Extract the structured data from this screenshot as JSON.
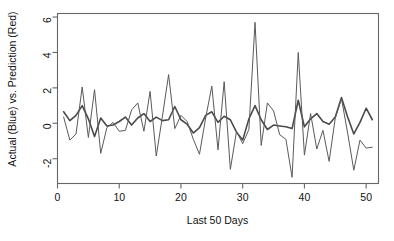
{
  "chart_data": {
    "type": "line",
    "title": "",
    "xlabel": "Last 50 Days",
    "ylabel": "Actual (Blue) vs. Prediction (Red)",
    "xlim": [
      0,
      52
    ],
    "ylim": [
      -3.4,
      6.2
    ],
    "xticks": [
      0,
      10,
      20,
      30,
      40,
      50
    ],
    "xtick_labels": [
      "0",
      "10",
      "20",
      "30",
      "40",
      "50"
    ],
    "yticks": [
      -2,
      0,
      2,
      4,
      6
    ],
    "ytick_labels": [
      "-2",
      "0",
      "2",
      "4",
      "6"
    ],
    "grid": false,
    "legend": "none",
    "frame": true,
    "x": [
      1,
      2,
      3,
      4,
      5,
      6,
      7,
      8,
      9,
      10,
      11,
      12,
      13,
      14,
      15,
      16,
      17,
      18,
      19,
      20,
      21,
      22,
      23,
      24,
      25,
      26,
      27,
      28,
      29,
      30,
      31,
      32,
      33,
      34,
      35,
      36,
      37,
      38,
      39,
      40,
      41,
      42,
      43,
      44,
      45,
      46,
      47,
      48,
      49,
      50,
      51
    ],
    "series": [
      {
        "name": "Actual (Blue)",
        "color": "#4a4a4a",
        "width": 1.6,
        "values": [
          0.65,
          0.15,
          0.45,
          1.0,
          0.25,
          -0.75,
          0.3,
          -0.15,
          -0.1,
          0.1,
          0.35,
          -0.1,
          0.3,
          0.55,
          0.1,
          0.35,
          0.15,
          0.2,
          0.95,
          0.2,
          -0.05,
          -0.55,
          -0.25,
          0.45,
          0.65,
          0.05,
          0.4,
          0.2,
          -0.5,
          -0.95,
          0.25,
          1.0,
          0.2,
          -0.35,
          -0.1,
          -0.15,
          -0.2,
          -0.3,
          1.3,
          -0.2,
          0.25,
          0.55,
          0.1,
          -0.05,
          0.35,
          1.45,
          0.35,
          -0.6,
          0.05,
          0.85,
          0.2
        ]
      },
      {
        "name": "Prediction (Red)",
        "color": "#5a5a5a",
        "width": 1.0,
        "values": [
          0.35,
          -0.95,
          -0.6,
          2.05,
          -0.8,
          1.9,
          -1.7,
          -0.25,
          0.05,
          -0.45,
          -0.4,
          0.75,
          1.15,
          -0.45,
          1.8,
          -1.85,
          0.4,
          2.75,
          -0.3,
          0.45,
          0.1,
          -0.9,
          -1.75,
          0.3,
          2.1,
          -1.5,
          2.35,
          -2.6,
          -0.45,
          -1.15,
          -0.35,
          5.7,
          -1.25,
          1.15,
          0.7,
          -0.65,
          -0.9,
          -3.05,
          4.0,
          -1.8,
          0.55,
          -1.45,
          -0.4,
          -2.15,
          0.3,
          1.4,
          -0.55,
          -2.65,
          -0.95,
          -1.4,
          -1.35
        ]
      }
    ]
  }
}
